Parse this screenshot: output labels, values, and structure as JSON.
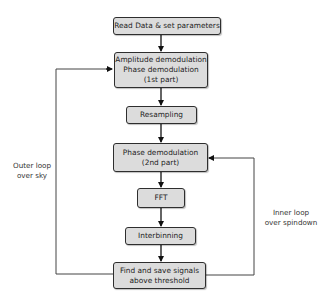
{
  "diagram": {
    "type": "flowchart",
    "nodes": [
      {
        "id": "read",
        "lines": [
          "Read Data & set parameters"
        ]
      },
      {
        "id": "demod1",
        "lines": [
          "Amplitude demodulation",
          "Phase demodulation",
          "(1st part)"
        ]
      },
      {
        "id": "resample",
        "lines": [
          "Resampling"
        ]
      },
      {
        "id": "demod2",
        "lines": [
          "Phase demodulation",
          "(2nd part)"
        ]
      },
      {
        "id": "fft",
        "lines": [
          "FFT"
        ]
      },
      {
        "id": "interbin",
        "lines": [
          "Interbinning"
        ]
      },
      {
        "id": "find",
        "lines": [
          "Find and save signals",
          "above threshold"
        ]
      }
    ],
    "loops": {
      "outer": {
        "lines": [
          "Outer loop",
          "over sky"
        ],
        "from": "find",
        "to": "demod1"
      },
      "inner": {
        "lines": [
          "Inner loop",
          "over spindown"
        ],
        "from": "find",
        "to": "demod2"
      }
    },
    "colors": {
      "box_fill": "#dcdcdc",
      "box_border": "#2e2e2e",
      "arrow": "#111111",
      "loop_line": "#555555"
    }
  }
}
